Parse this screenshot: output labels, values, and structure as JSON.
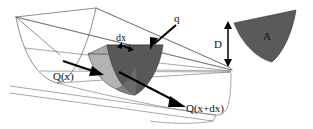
{
  "figure": {
    "background_color": "#ffffff",
    "line_color": "#5f5f5f",
    "labels": {
      "inflow": "Q(x)",
      "outflow": "Q(x+dx)",
      "lateral_inflow": "q",
      "thickness": "dx",
      "area": "A",
      "depth": "D"
    },
    "shading": {
      "upstream_face_color": "#b3b3b3",
      "downstream_face_color": "#585858",
      "top_strip_color": "#a9a9a9",
      "inset_area_color": "#5a5a5a",
      "shadow_color": "#7d7d7d"
    },
    "annotations": [
      {
        "name": "inflow-arrow",
        "label": "Q(x)",
        "direction": "right-down"
      },
      {
        "name": "outflow-arrow",
        "label": "Q(x+dx)",
        "direction": "right-down"
      },
      {
        "name": "lateral-inflow-arrow",
        "label": "q",
        "direction": "down-left"
      },
      {
        "name": "thickness-arrow",
        "label": "dx",
        "direction": "double-horizontal"
      },
      {
        "name": "depth-arrow",
        "label": "D",
        "direction": "double-vertical"
      }
    ]
  }
}
